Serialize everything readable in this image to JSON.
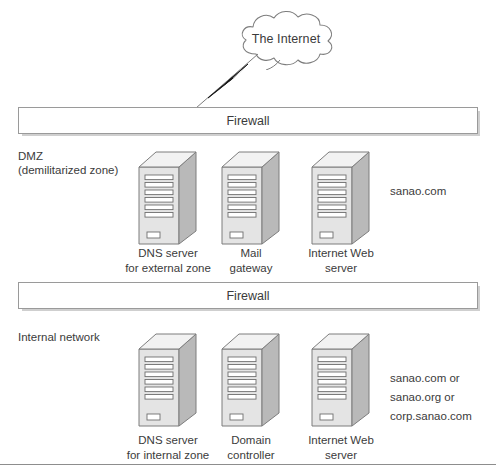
{
  "figure": {
    "internet": {
      "label": "The Internet",
      "icon": "cloud-icon",
      "link_icon": "lightning-bolt-icon"
    },
    "firewalls": [
      {
        "label": "Firewall"
      },
      {
        "label": "Firewall"
      }
    ],
    "zones": [
      {
        "name": "dmz",
        "label": "DMZ\n(demilitarized zone)",
        "domain_note": [
          "sanao.com"
        ],
        "servers": [
          {
            "icon": "server-tower-icon",
            "caption": "DNS server\nfor external zone"
          },
          {
            "icon": "server-tower-icon",
            "caption": "Mail\ngateway"
          },
          {
            "icon": "server-tower-icon",
            "caption": "Internet Web\nserver"
          }
        ]
      },
      {
        "name": "internal",
        "label": "Internal network",
        "domain_note": [
          "sanao.com or",
          "sanao.org or",
          "corp.sanao.com"
        ],
        "servers": [
          {
            "icon": "server-tower-icon",
            "caption": "DNS server\nfor internal zone"
          },
          {
            "icon": "server-tower-icon",
            "caption": "Domain\ncontroller"
          },
          {
            "icon": "server-tower-icon",
            "caption": "Internet Web\nserver"
          }
        ]
      }
    ],
    "colors": {
      "outline": "#8d8d8d",
      "text": "#3b3b3b",
      "server_front": "#e4e4e4",
      "server_side": "#b9b9b9",
      "server_top": "#f2f2f2",
      "shadow": "#cfcfcf"
    }
  }
}
